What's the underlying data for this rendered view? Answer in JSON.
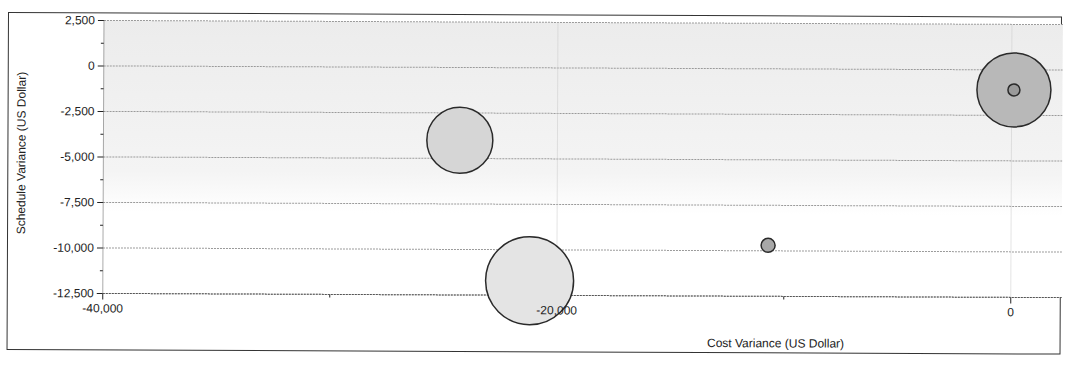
{
  "chart_data": {
    "type": "scatter",
    "subtype": "bubble",
    "title": "",
    "xlabel": "Cost Variance (US Dollar)",
    "ylabel": "Schedule Variance (US Dollar)",
    "xlim": [
      -40000,
      2000
    ],
    "ylim": [
      -12500,
      2500
    ],
    "x_ticks": [
      -40000,
      -20000,
      0
    ],
    "x_tick_labels": [
      "-40,000",
      "-20,000",
      "0"
    ],
    "x_minor_ticks": [
      -30000,
      -10000
    ],
    "y_ticks": [
      2500,
      0,
      -2500,
      -5000,
      -7500,
      -10000,
      -12500
    ],
    "y_tick_labels": [
      "2,500",
      "0",
      "-2,500",
      "-5,000",
      "-7,500",
      "-10,000",
      "-12,500"
    ],
    "grid": true,
    "legend": "none",
    "series": [
      {
        "name": "bubble-1",
        "x": -24300,
        "y": -4000,
        "size": 33,
        "fill": "#d6d6d6"
      },
      {
        "name": "bubble-2",
        "x": -21200,
        "y": -11700,
        "size": 44,
        "fill": "#e4e4e4"
      },
      {
        "name": "bubble-3",
        "x": -10700,
        "y": -9700,
        "size": 7,
        "fill": "#a8a8a8"
      },
      {
        "name": "bubble-4",
        "x": 100,
        "y": -1100,
        "size": 37,
        "fill": "#b8b8b8"
      },
      {
        "name": "bubble-5",
        "x": 100,
        "y": -1100,
        "size": 6,
        "fill": "#9a9a9a"
      }
    ]
  },
  "colors": {
    "plot_background_top": "#ededed",
    "plot_background_bottom": "#ffffff",
    "gridline": "#9a9a9a",
    "bubble_stroke": "#2a2a2a",
    "frame": "#333333"
  }
}
